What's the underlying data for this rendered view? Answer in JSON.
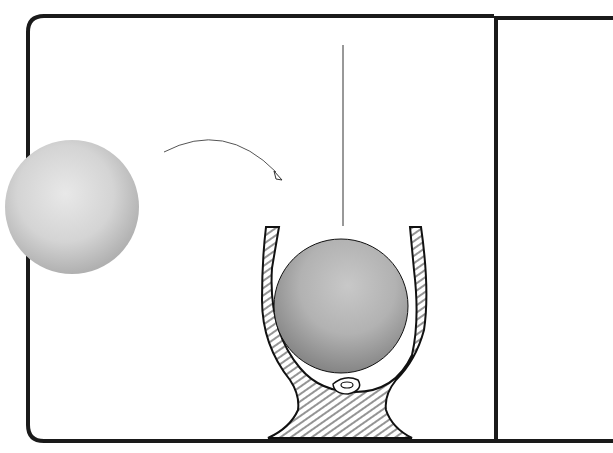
{
  "scene": {
    "description": "Two-panel illustration: a sphere moves along a curved arrow into a wooden cradle, where a sphere hangs from a thread",
    "panels": [
      {
        "id": "left-panel",
        "content": "sphere, curved arrow, suspended sphere in wood-grain cradle"
      },
      {
        "id": "right-panel",
        "content": "empty"
      }
    ],
    "colors": {
      "background": "#ffffff",
      "border": "#1a1a1a",
      "sphere_light": "#d9d9d9",
      "sphere_dark": "#9a9a9a",
      "arrow": "#555555"
    }
  }
}
